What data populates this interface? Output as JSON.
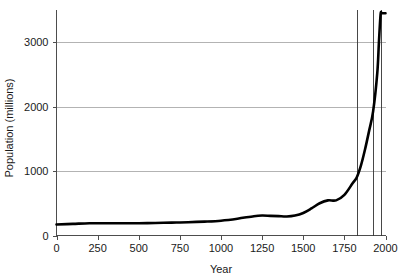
{
  "chart_data": {
    "type": "line",
    "title": "",
    "xlabel": "Year",
    "ylabel": "Population (millions)",
    "xlim": [
      0,
      2000
    ],
    "ylim": [
      0,
      3500
    ],
    "grid": true,
    "legend": "none",
    "x_ticks": [
      0,
      250,
      500,
      750,
      1000,
      1250,
      1500,
      1750,
      2000
    ],
    "x_tick_labels": [
      "0",
      "250",
      "500",
      "750",
      "1000",
      "1250",
      "1500",
      "1750",
      "2000"
    ],
    "y_ticks": [
      0,
      1000,
      2000,
      3000
    ],
    "y_tick_labels": [
      "0",
      "1000",
      "2000",
      "3000"
    ],
    "series": [
      {
        "name": "World population",
        "x": [
          0,
          100,
          200,
          300,
          400,
          500,
          600,
          700,
          800,
          900,
          1000,
          1100,
          1200,
          1250,
          1300,
          1350,
          1400,
          1450,
          1500,
          1550,
          1600,
          1650,
          1700,
          1750,
          1800,
          1825,
          1850,
          1875,
          1900,
          1925,
          1950,
          1960,
          1970,
          1975,
          1980,
          1990,
          2000
        ],
        "y": [
          170,
          180,
          190,
          190,
          190,
          190,
          195,
          200,
          205,
          215,
          230,
          260,
          300,
          310,
          305,
          300,
          295,
          310,
          350,
          420,
          500,
          545,
          545,
          630,
          810,
          900,
          1080,
          1330,
          1620,
          1930,
          2520,
          3000,
          3430,
          3450,
          3450,
          3450,
          3450
        ]
      }
    ],
    "reference_lines": [
      {
        "name": "ref-line-1825",
        "x": 1825
      },
      {
        "name": "ref-line-1925",
        "x": 1925
      },
      {
        "name": "ref-line-1975",
        "x": 1975
      }
    ]
  }
}
